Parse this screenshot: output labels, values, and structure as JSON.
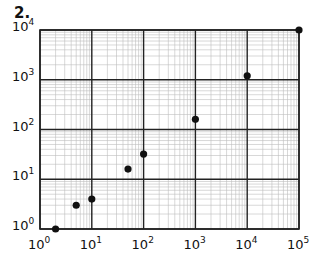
{
  "figure": {
    "number_label": "2."
  },
  "chart_data": {
    "type": "scatter",
    "title": "",
    "xlabel": "",
    "ylabel": "",
    "xscale": "log",
    "yscale": "log",
    "xlim": [
      1,
      100000
    ],
    "ylim": [
      1,
      10000
    ],
    "grid": true,
    "legend": null,
    "x_tick_labels": [
      {
        "base": "10",
        "exp": "0"
      },
      {
        "base": "10",
        "exp": "1"
      },
      {
        "base": "10",
        "exp": "2"
      },
      {
        "base": "10",
        "exp": "3"
      },
      {
        "base": "10",
        "exp": "4"
      },
      {
        "base": "10",
        "exp": "5"
      }
    ],
    "y_tick_labels": [
      {
        "base": "10",
        "exp": "0"
      },
      {
        "base": "10",
        "exp": "1"
      },
      {
        "base": "10",
        "exp": "2"
      },
      {
        "base": "10",
        "exp": "3"
      },
      {
        "base": "10",
        "exp": "4"
      }
    ],
    "points": [
      {
        "x": 2,
        "y": 1
      },
      {
        "x": 5,
        "y": 3
      },
      {
        "x": 10,
        "y": 4
      },
      {
        "x": 50,
        "y": 16
      },
      {
        "x": 100,
        "y": 32
      },
      {
        "x": 1000,
        "y": 160
      },
      {
        "x": 10000,
        "y": 1200
      },
      {
        "x": 100000,
        "y": 10000
      }
    ],
    "colors": {
      "point": "#111111",
      "major_grid": "#222222",
      "minor_grid": "#bdbdbd"
    }
  }
}
